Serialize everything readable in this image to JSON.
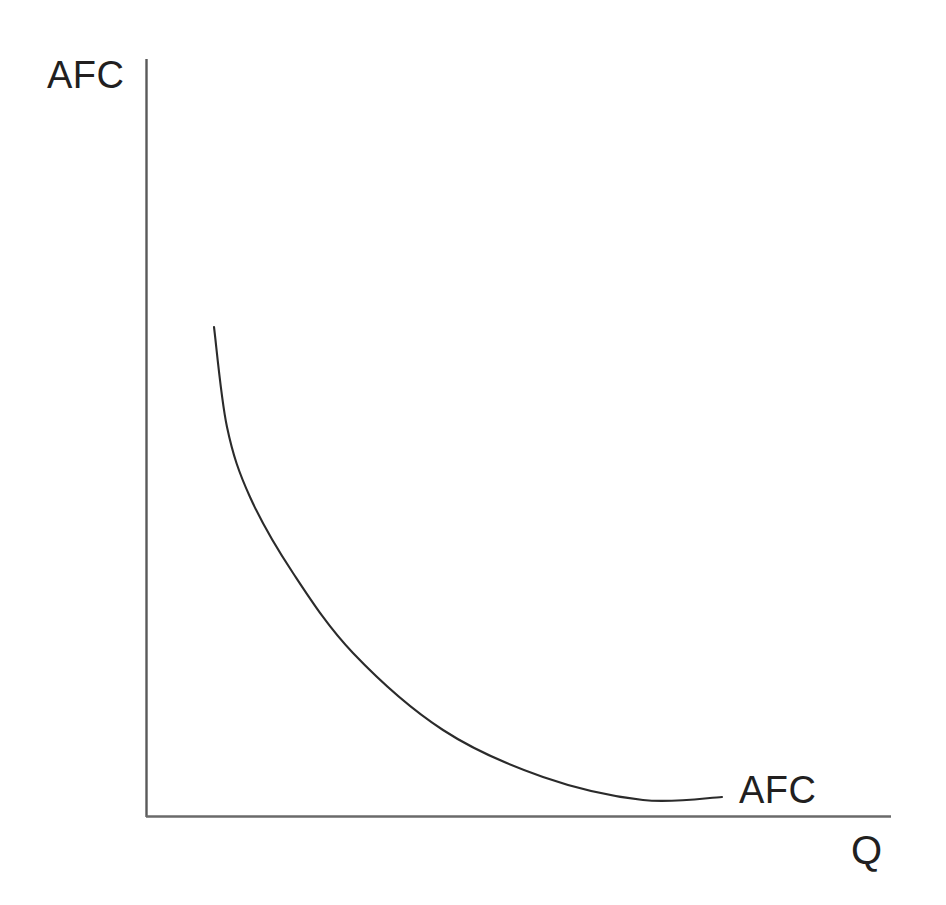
{
  "figure": {
    "background_color": "#ffffff",
    "ink_color": "#221f1f",
    "axis_color": "#555555",
    "width": 946,
    "height": 905
  },
  "labels": {
    "y_axis_title": "AFC",
    "x_axis_title": "Q",
    "curve_label": "AFC"
  },
  "chart_data": {
    "type": "line",
    "title": "",
    "subtitle": "",
    "xlabel": "Q",
    "ylabel": "AFC",
    "grid": false,
    "legend": false,
    "annotations": [
      {
        "text": "AFC",
        "x": 0.79,
        "y": 0.025,
        "role": "curve-label"
      }
    ],
    "axis_style": {
      "x_axis": {
        "visible": true,
        "ticks": false,
        "tick_labels": false,
        "arrow": false
      },
      "y_axis": {
        "visible": true,
        "ticks": false,
        "tick_labels": false,
        "arrow": false
      }
    },
    "xlim": [
      0,
      1
    ],
    "ylim": [
      0,
      1
    ],
    "series": [
      {
        "name": "AFC",
        "description": "Average Fixed Cost: rectangular-hyperbola shape, falling steeply then flattening asymptotically toward the quantity axis",
        "x": [
          0.091,
          0.109,
          0.14,
          0.198,
          0.278,
          0.399,
          0.534,
          0.667,
          0.745
        ],
        "y": [
          0.643,
          0.514,
          0.42,
          0.32,
          0.215,
          0.115,
          0.053,
          0.021,
          0.011
        ]
      }
    ],
    "pixel_geometry": {
      "y_axis_x": 146,
      "y_axis_top": 59,
      "x_axis_y": 816,
      "x_axis_right": 891,
      "curve_points": [
        [
          214,
          327
        ],
        [
          227,
          427
        ],
        [
          250,
          497
        ],
        [
          293,
          573
        ],
        [
          353,
          653
        ],
        [
          443,
          730
        ],
        [
          543,
          777
        ],
        [
          643,
          800
        ],
        [
          722,
          797
        ]
      ]
    }
  }
}
